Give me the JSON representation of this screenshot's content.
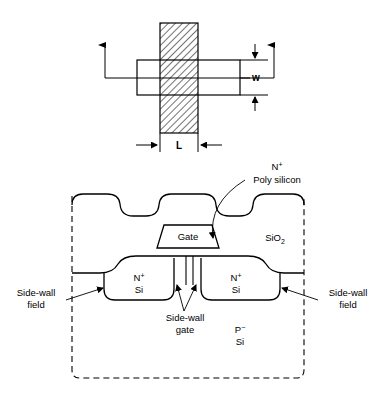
{
  "figure": {
    "stroke_color": "#000000",
    "background_color": "#ffffff",
    "hatch_color": "#000000"
  },
  "top_view": {
    "name": "plan-view-layout",
    "dimension_w": "w",
    "dimension_l": "L",
    "gate_stripe": {
      "name": "hatched-gate-stripe",
      "fill": "hatched"
    },
    "active_rectangle": {
      "name": "active-area-rectangle",
      "fill": "none"
    }
  },
  "cross_section": {
    "name": "device-cross-section",
    "labels": {
      "poly_silicon_sup": "N",
      "poly_silicon_sup_sign": "+",
      "poly_silicon": "Poly silicon",
      "gate": "Gate",
      "oxide_base": "SiO",
      "oxide_sub": "2",
      "source_sup": "N",
      "source_sup_sign": "+",
      "source_base": "Si",
      "drain_sup": "N",
      "drain_sup_sign": "+",
      "drain_base": "Si",
      "substrate_sup": "P",
      "substrate_sup_sign": "−",
      "substrate_base": "Si",
      "sidewall_field_left_line1": "Side-wall",
      "sidewall_field_left_line2": "field",
      "sidewall_field_right_line1": "Side-wall",
      "sidewall_field_right_line2": "field",
      "sidewall_gate_line1": "Side-wall",
      "sidewall_gate_line2": "gate"
    }
  }
}
